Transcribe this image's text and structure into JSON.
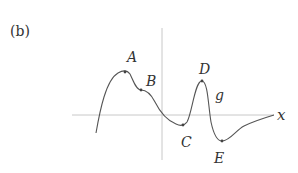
{
  "panel_label": "(b)",
  "axis_label_x": "x",
  "function_label": "g",
  "points": [
    {
      "name": "A",
      "x": 125,
      "y": 72,
      "lx": 127,
      "ly": 62
    },
    {
      "name": "B",
      "x": 141,
      "y": 90,
      "lx": 146,
      "ly": 86
    },
    {
      "name": "C",
      "x": 183,
      "y": 125,
      "lx": 181,
      "ly": 147
    },
    {
      "name": "D",
      "x": 202,
      "y": 81,
      "lx": 199,
      "ly": 74
    },
    {
      "name": "E",
      "x": 222,
      "y": 141,
      "lx": 214,
      "ly": 163
    }
  ],
  "colors": {
    "axis": "#c8c8c8",
    "curve": "#555555",
    "text": "#333333"
  }
}
